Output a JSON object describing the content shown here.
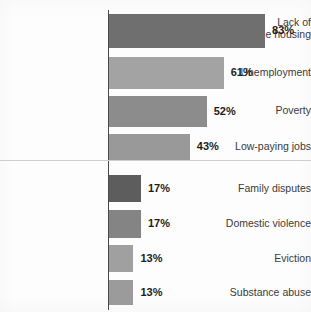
{
  "chart_data": {
    "type": "bar",
    "orientation": "horizontal",
    "title": "",
    "subtitle": "",
    "xlabel": "",
    "ylabel": "",
    "xlim": [
      0,
      100
    ],
    "grid": false,
    "legend": "none",
    "value_suffix": "%",
    "categories": [
      "Lack of\naffordable housing",
      "Unemployment",
      "Poverty",
      "Low-paying jobs",
      "Family disputes",
      "Domestic violence",
      "Eviction",
      "Substance abuse"
    ],
    "values": [
      83,
      61,
      52,
      43,
      17,
      17,
      13,
      13
    ],
    "value_labels": [
      "83%",
      "61%",
      "52%",
      "43%",
      "17%",
      "17%",
      "13%",
      "13%"
    ],
    "bar_colors": [
      "#6f6f6f",
      "#a3a3a3",
      "#8c8c8c",
      "#999999",
      "#5d5d5d",
      "#848484",
      "#a0a0a0",
      "#9b9b9b"
    ],
    "axis_color": "#4a4a4a",
    "divider_color": "#cfcfcf",
    "background_color": "#fdfdfd",
    "label_color": "#3a3a3a",
    "value_color": "#1c1c1c"
  },
  "layout": {
    "axis_x": 108,
    "bar_origin_x": 109,
    "pixels_per_unit": 1.88,
    "divider_y": 160,
    "rows": [
      {
        "bar_top": 14,
        "bar_height": 34,
        "label_top": 16
      },
      {
        "bar_top": 57,
        "bar_height": 32,
        "label_top": 66
      },
      {
        "bar_top": 96,
        "bar_height": 31,
        "label_top": 104
      },
      {
        "bar_top": 134,
        "bar_height": 26,
        "label_top": 140
      },
      {
        "bar_top": 175,
        "bar_height": 27,
        "label_top": 182
      },
      {
        "bar_top": 210,
        "bar_height": 28,
        "label_top": 217
      },
      {
        "bar_top": 245,
        "bar_height": 27,
        "label_top": 252
      },
      {
        "bar_top": 280,
        "bar_height": 25,
        "label_top": 286
      }
    ]
  }
}
